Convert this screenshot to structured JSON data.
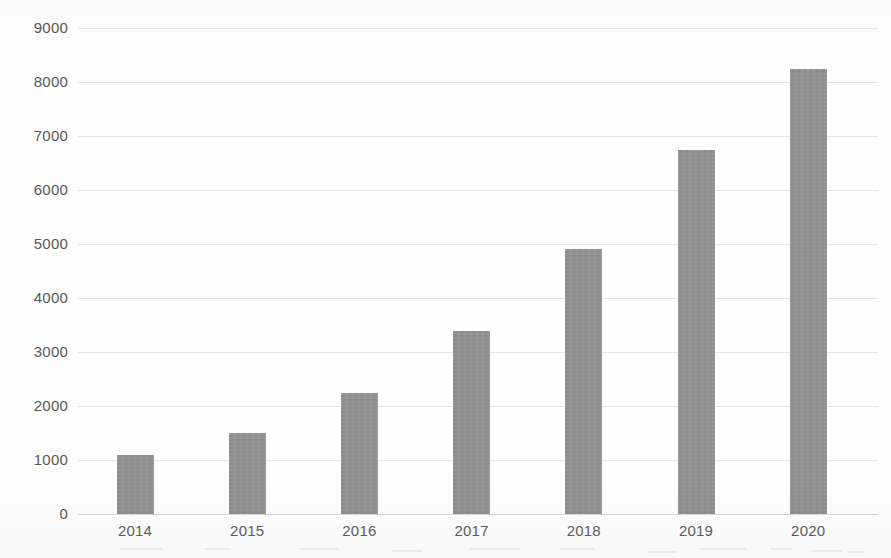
{
  "chart_data": {
    "type": "bar",
    "title": "",
    "subtitle": "",
    "xlabel": "",
    "ylabel": "",
    "categories": [
      "2014",
      "2015",
      "2016",
      "2017",
      "2018",
      "2019",
      "2020"
    ],
    "values": [
      1090,
      1500,
      2250,
      3380,
      4900,
      6750,
      8250
    ],
    "series": [
      {
        "name": "Series 1",
        "values": [
          1090,
          1500,
          2250,
          3380,
          4900,
          6750,
          8250
        ]
      }
    ],
    "ylim": [
      0,
      9000
    ],
    "y_ticks": [
      0,
      1000,
      2000,
      3000,
      4000,
      5000,
      6000,
      7000,
      8000,
      9000
    ],
    "y_tick_labels": [
      "0",
      "1000",
      "2000",
      "3000",
      "4000",
      "5000",
      "6000",
      "7000",
      "8000",
      "9000"
    ],
    "x_tick_labels": [
      "2014",
      "2015",
      "2016",
      "2017",
      "2018",
      "2019",
      "2020"
    ],
    "grid": true,
    "grid_axis": "y",
    "legend": false,
    "legend_position": "none",
    "bar_color": "#919191",
    "gridline_color": "#e4e4e4",
    "axis_label_color": "#585858",
    "background_color": "#ffffff"
  },
  "axes": {
    "y_labels": [
      {
        "text": "9000",
        "value": 9000
      },
      {
        "text": "8000",
        "value": 8000
      },
      {
        "text": "7000",
        "value": 7000
      },
      {
        "text": "6000",
        "value": 6000
      },
      {
        "text": "5000",
        "value": 5000
      },
      {
        "text": "4000",
        "value": 4000
      },
      {
        "text": "3000",
        "value": 3000
      },
      {
        "text": "2000",
        "value": 2000
      },
      {
        "text": "1000",
        "value": 1000
      },
      {
        "text": "0",
        "value": 0
      }
    ],
    "x_labels": [
      {
        "text": "2014"
      },
      {
        "text": "2015"
      },
      {
        "text": "2016"
      },
      {
        "text": "2017"
      },
      {
        "text": "2018"
      },
      {
        "text": "2019"
      },
      {
        "text": "2020"
      }
    ]
  }
}
